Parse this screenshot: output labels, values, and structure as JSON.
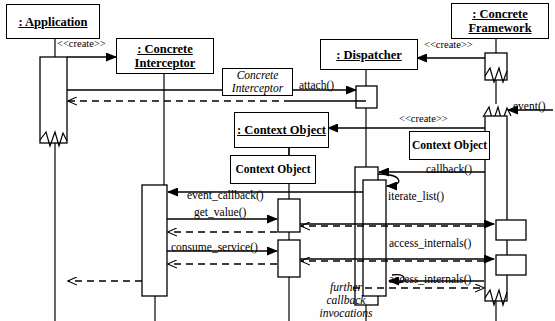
{
  "diagram": {
    "kind": "uml-sequence-diagram",
    "width": 555,
    "height": 321,
    "background": "#fefefe",
    "line_color": "#000000"
  },
  "participants": [
    {
      "id": "application",
      "label": ": Application",
      "lifeline_x": 55,
      "box": {
        "x": 6,
        "y": 4,
        "w": 92,
        "h": 33
      }
    },
    {
      "id": "concrete_interceptor",
      "label": ": Concrete Interceptor",
      "lifeline_x": 155,
      "box": {
        "x": 116,
        "y": 38,
        "w": 96,
        "h": 34
      }
    },
    {
      "id": "dispatcher",
      "label": ": Dispatcher",
      "lifeline_x": 366,
      "box": {
        "x": 320,
        "y": 39,
        "w": 96,
        "h": 29
      }
    },
    {
      "id": "concrete_framework",
      "label": ": Concrete Framework",
      "lifeline_x": 496,
      "box": {
        "x": 451,
        "y": 3,
        "w": 96,
        "h": 34
      }
    },
    {
      "id": "context_object",
      "label": ": Context Object",
      "lifeline_x": 289,
      "box": {
        "x": 234,
        "y": 112,
        "w": 93,
        "h": 34
      }
    }
  ],
  "param_boxes": [
    {
      "id": "concrete-interceptor-param",
      "label": "Concrete Interceptor",
      "italic": true,
      "x": 222,
      "y": 68,
      "w": 69,
      "h": 26
    },
    {
      "id": "context-object-param-left",
      "label": "Context Object",
      "italic": false,
      "x": 230,
      "y": 155,
      "w": 84,
      "h": 27
    },
    {
      "id": "context-object-param-right",
      "label": "Context Object",
      "italic": false,
      "x": 409,
      "y": 131,
      "w": 79,
      "h": 27
    }
  ],
  "messages": [
    {
      "id": "create-interceptor",
      "label": "<<create>>",
      "x": 57,
      "y": 38,
      "kind": "stereotype"
    },
    {
      "id": "create-dispatcher",
      "label": "<<create>>",
      "x": 424,
      "y": 39,
      "kind": "stereotype"
    },
    {
      "id": "create-context",
      "label": "<<create>>",
      "x": 399,
      "y": 113,
      "kind": "stereotype"
    },
    {
      "id": "attach",
      "label": "attach()",
      "x": 299,
      "y": 79,
      "kind": "call"
    },
    {
      "id": "event",
      "label": "event()",
      "x": 513,
      "y": 100,
      "kind": "call"
    },
    {
      "id": "callback",
      "label": "callback()",
      "x": 426,
      "y": 163,
      "kind": "call"
    },
    {
      "id": "iterate-list",
      "label": "iterate_list()",
      "x": 388,
      "y": 190,
      "kind": "call"
    },
    {
      "id": "event-callback",
      "label": "event_callback()",
      "x": 187,
      "y": 189,
      "kind": "call"
    },
    {
      "id": "get-value",
      "label": "get_value()",
      "x": 194,
      "y": 206,
      "kind": "call"
    },
    {
      "id": "consume-service",
      "label": "consume_service()",
      "x": 171,
      "y": 241,
      "kind": "call"
    },
    {
      "id": "access-internals-1",
      "label": "access_internals()",
      "x": 389,
      "y": 237,
      "kind": "call"
    },
    {
      "id": "access-internals-2",
      "label": "access_internals()",
      "x": 389,
      "y": 273,
      "kind": "call"
    }
  ],
  "notes": [
    {
      "id": "further-callback-invocations",
      "lines": [
        "further",
        "callback",
        "invocations"
      ],
      "x": 303,
      "y": 281
    }
  ]
}
